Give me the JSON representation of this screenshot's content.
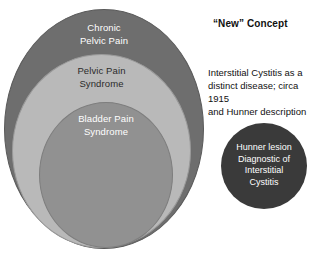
{
  "diagram": {
    "background_color": "#ffffff",
    "rings": [
      {
        "name": "chronic-pelvic-pain",
        "label": "Chronic\nPelvic Pain",
        "fill_color": "#6e6e6e",
        "text_color": "#ffffff"
      },
      {
        "name": "pelvic-pain-syndrome",
        "label": "Pelvic Pain\nSyndrome",
        "fill_color": "#b9b9b9",
        "text_color": "#2b2b2b"
      },
      {
        "name": "bladder-pain-syndrome",
        "label": "Bladder Pain\nSyndrome",
        "fill_color": "#919191",
        "text_color": "#ffffff"
      }
    ],
    "hunner_circle": {
      "name": "hunner-lesion",
      "label": "Hunner lesion\nDiagnostic of\nInterstitial\nCystitis",
      "fill_color": "#3a3a3a",
      "text_color": "#ffffff"
    },
    "annotations": {
      "heading": "“New” Concept",
      "paragraph": "Interstitial Cystitis as a\ndistinct disease; circa 1915\nand Hunner description",
      "text_color": "#111111"
    }
  }
}
